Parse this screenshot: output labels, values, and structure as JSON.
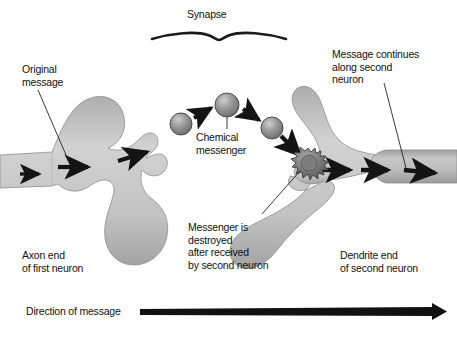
{
  "figure": {
    "background_color": "#ffffff",
    "width": 457,
    "height": 338
  },
  "colors": {
    "neuron_light": "#cbcbcb",
    "neuron_mid": "#b4b4b4",
    "neuron_dark": "#9a9a9a",
    "sphere_fill": "#8f8f8f",
    "sphere_highlight": "#c9c9c9",
    "arrow_black": "#1a1a1a",
    "text": "#111111",
    "leader_line": "#222222",
    "destroyed_blob": "#6f6f6f"
  },
  "labels": {
    "synapse": "Synapse",
    "original_message": "Original\nmessage",
    "message_continues": "Message continues\nalong second\nneuron",
    "chemical_messenger": "Chemical\nmessenger",
    "messenger_destroyed": "Messenger is\ndestroyed\nafter received\nby second neuron",
    "axon_end": "Axon end\nof first neuron",
    "dendrite_end": "Dendrite end\nof second neuron",
    "direction_of_message": "Direction of message"
  },
  "elements": {
    "first_neuron_name": "axon-terminal-first-neuron",
    "second_neuron_name": "dendrite-second-neuron",
    "messenger_count": 3,
    "messenger_positions": [
      {
        "cx": 181,
        "cy": 124,
        "r": 11
      },
      {
        "cx": 227,
        "cy": 105,
        "r": 12
      },
      {
        "cx": 272,
        "cy": 128,
        "r": 11
      }
    ],
    "destroyed_blob": {
      "cx": 308,
      "cy": 163,
      "r": 15
    },
    "flow_arrows_first_neuron": 3,
    "flow_arrows_second_neuron": 3,
    "transfer_arrows": 3,
    "direction_arrow": {
      "x1": 140,
      "y1": 312,
      "x2": 446,
      "y2": 312
    }
  }
}
